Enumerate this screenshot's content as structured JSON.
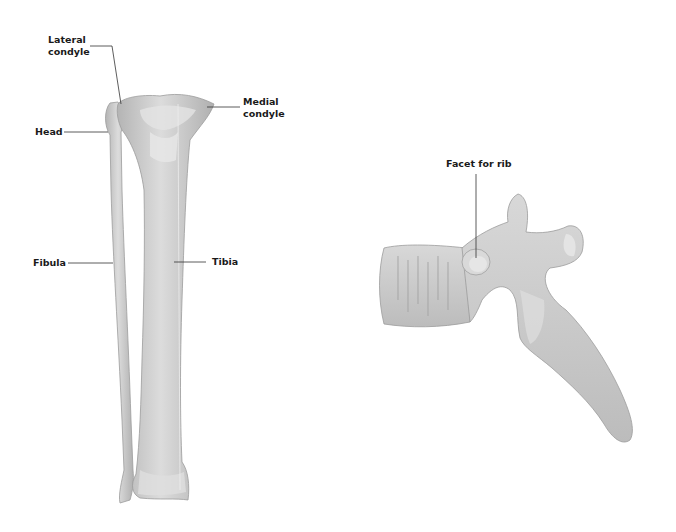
{
  "figures": {
    "leg": {
      "labels": {
        "lateral_condyle": "Lateral\ncondyle",
        "medial_condyle": "Medial\ncondyle",
        "head": "Head",
        "fibula": "Fibula",
        "tibia": "Tibia"
      }
    },
    "vertebra": {
      "labels": {
        "facet_for_rib": "Facet for rib"
      }
    }
  },
  "colors": {
    "bone_fill": "#c8c8c8",
    "bone_light": "#e2e2e2",
    "bone_shadow": "#a8a8a8",
    "leader_line": "#333333",
    "label_text": "#1a1a1a"
  }
}
